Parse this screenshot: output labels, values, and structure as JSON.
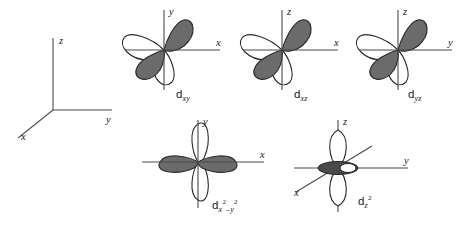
{
  "figure": {
    "type": "orbital-diagram",
    "title": "",
    "background_color": "#ffffff",
    "lobe_shaded_color": "#6b6b6b",
    "lobe_unshaded_color": "#ffffff",
    "outline_color": "#2a2a2a",
    "axis_color": "#4a4a4a"
  },
  "reference_axes": {
    "name": "coordinate-axes",
    "labels": {
      "z": "z",
      "y": "y",
      "x": "x"
    },
    "description": "3D Cartesian reference frame: z vertical up, y horizontal right, x toward lower-left"
  },
  "orbitals": [
    {
      "id": "dxy",
      "label_base": "d",
      "label_sub": "xy",
      "horizontal_axis": "x",
      "vertical_axis": "y",
      "lobe_orientation": "between-axes",
      "shaded_quadrants": [
        1,
        3
      ],
      "unshaded_quadrants": [
        2,
        4
      ],
      "lobe_count": 4
    },
    {
      "id": "dxz",
      "label_base": "d",
      "label_sub": "xz",
      "horizontal_axis": "x",
      "vertical_axis": "z",
      "lobe_orientation": "between-axes",
      "shaded_quadrants": [
        1,
        3
      ],
      "unshaded_quadrants": [
        2,
        4
      ],
      "lobe_count": 4
    },
    {
      "id": "dyz",
      "label_base": "d",
      "label_sub": "yz",
      "horizontal_axis": "y",
      "vertical_axis": "z",
      "lobe_orientation": "between-axes",
      "shaded_quadrants": [
        1,
        3
      ],
      "unshaded_quadrants": [
        2,
        4
      ],
      "lobe_count": 4
    },
    {
      "id": "dx2y2",
      "label_base": "d",
      "label_sub_x": "x",
      "label_sup_x": "2",
      "label_minus": "–",
      "label_sub_y": "y",
      "label_sup_y": "2",
      "horizontal_axis": "x",
      "vertical_axis": "y",
      "lobe_orientation": "along-axes",
      "shaded_lobes": [
        "+x",
        "-x"
      ],
      "unshaded_lobes": [
        "+y",
        "-y"
      ],
      "lobe_count": 4
    },
    {
      "id": "dz2",
      "label_base": "d",
      "label_sub_z": "z",
      "label_sup_z": "2",
      "horizontal_axis": "y",
      "vertical_axis": "z",
      "diagonal_axis": "x",
      "lobe_orientation": "along-z-with-torus",
      "shaded_parts": [
        "torus"
      ],
      "unshaded_parts": [
        "+z lobe",
        "-z lobe"
      ],
      "lobe_count": 2
    }
  ]
}
